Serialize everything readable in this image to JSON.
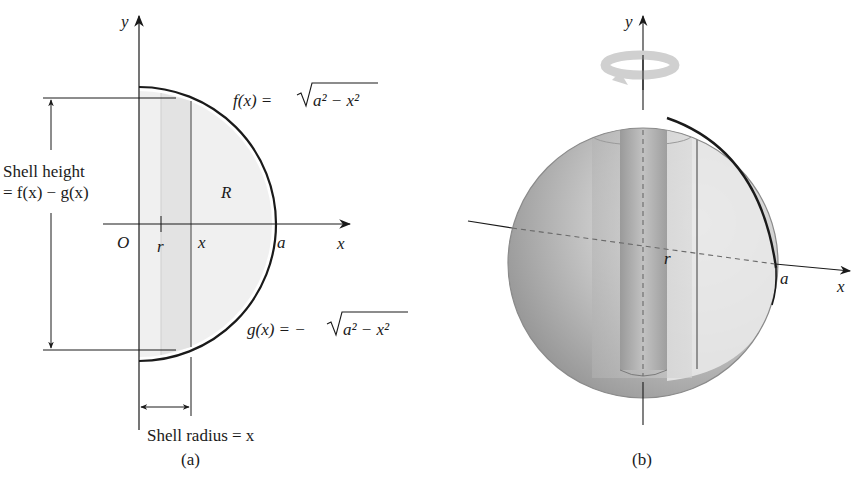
{
  "panel_a": {
    "caption": "(a)",
    "axis_y_label": "y",
    "axis_x_label": "x",
    "origin_label": "O",
    "r_label": "r",
    "x_tick_label": "x",
    "a_label": "a",
    "region_label": "R",
    "f_label": "f(x) = ",
    "f_radicand": "a² − x²",
    "g_label": "g(x) = −",
    "g_radicand": "a² − x²",
    "shell_height_line1": "Shell height",
    "shell_height_line2": "= f(x) − g(x)",
    "shell_radius_label": "Shell radius = x"
  },
  "panel_b": {
    "caption": "(b)",
    "axis_y_label": "y",
    "axis_x_label": "x",
    "r_label": "r",
    "a_label": "a",
    "rotation_icon": "rotation-arrow-icon"
  },
  "colors": {
    "ink": "#1a1a1a",
    "region_fill": "#efefef",
    "strip_fill": "#e4e4e4",
    "sphere_dark": "#8e8e8e",
    "sphere_light": "#e6e6e6"
  }
}
